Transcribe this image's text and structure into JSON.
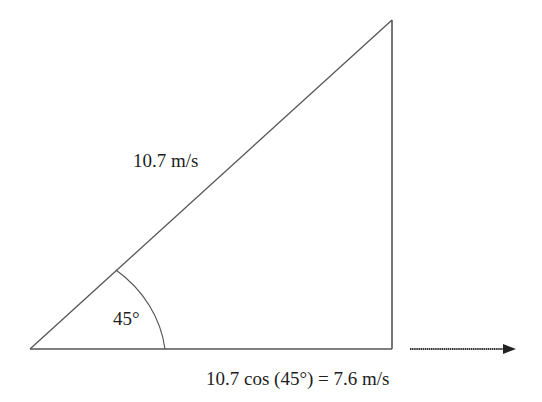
{
  "diagram": {
    "type": "right-triangle-vector-decomposition",
    "hypotenuse_label": "10.7 m/s",
    "angle_label": "45°",
    "horizontal_component_label": "10.7 cos (45°) = 7.6 m/s",
    "arrow_direction": "right",
    "colors": {
      "line": "#555555",
      "text": "#1e1e1e",
      "arrow": "#222222",
      "background": "#ffffff"
    }
  }
}
